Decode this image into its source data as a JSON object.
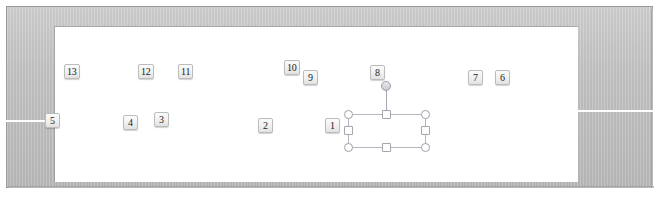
{
  "window": {
    "frame_color": "#bdbdbd",
    "canvas_color": "#ffffff",
    "guide_color": "#ffffff",
    "outer_border_color": "#9a9a9a"
  },
  "guides": [
    {
      "name": "left-guide-line",
      "label": ""
    },
    {
      "name": "right-guide-line",
      "label": ""
    }
  ],
  "callouts": [
    {
      "id": "callout-13",
      "label": "13",
      "x": 64,
      "y": 64
    },
    {
      "id": "callout-12",
      "label": "12",
      "x": 138,
      "y": 64
    },
    {
      "id": "callout-11",
      "label": "11",
      "x": 178,
      "y": 64
    },
    {
      "id": "callout-10",
      "label": "10",
      "x": 284,
      "y": 60
    },
    {
      "id": "callout-9",
      "label": "9",
      "x": 303,
      "y": 70
    },
    {
      "id": "callout-8",
      "label": "8",
      "x": 370,
      "y": 65
    },
    {
      "id": "callout-7",
      "label": "7",
      "x": 468,
      "y": 70
    },
    {
      "id": "callout-6",
      "label": "6",
      "x": 495,
      "y": 70
    },
    {
      "id": "callout-5",
      "label": "5",
      "x": 45,
      "y": 113
    },
    {
      "id": "callout-4",
      "label": "4",
      "x": 123,
      "y": 115
    },
    {
      "id": "callout-3",
      "label": "3",
      "x": 154,
      "y": 112
    },
    {
      "id": "callout-2",
      "label": "2",
      "x": 258,
      "y": 118
    },
    {
      "id": "callout-1",
      "label": "1",
      "x": 325,
      "y": 118
    }
  ],
  "selection": {
    "name": "shape-selection-frame",
    "border_color": "#b6b6bf",
    "handle_fill": "#ffffff",
    "handle_border": "#a5a5ae",
    "rotation_handle_name": "rotate-handle",
    "handles": [
      {
        "name": "handle-top-left",
        "shape": "circle",
        "x": 344,
        "y": 110
      },
      {
        "name": "handle-top-center",
        "shape": "square",
        "x": 382,
        "y": 110
      },
      {
        "name": "handle-top-right",
        "shape": "circle",
        "x": 421,
        "y": 110
      },
      {
        "name": "handle-middle-left",
        "shape": "square",
        "x": 344,
        "y": 126
      },
      {
        "name": "handle-middle-right",
        "shape": "square",
        "x": 421,
        "y": 126
      },
      {
        "name": "handle-bottom-left",
        "shape": "circle",
        "x": 344,
        "y": 143
      },
      {
        "name": "handle-bottom-center",
        "shape": "square",
        "x": 382,
        "y": 143
      },
      {
        "name": "handle-bottom-right",
        "shape": "circle",
        "x": 421,
        "y": 143
      }
    ],
    "rotate": {
      "x": 381,
      "y": 81
    }
  }
}
